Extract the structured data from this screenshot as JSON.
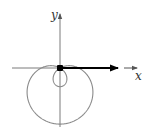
{
  "diagram": {
    "type": "polar-curve",
    "axes": {
      "x_label": "x",
      "y_label": "y"
    },
    "curve": {
      "equation": "r = a - b sin(theta)",
      "a": 1,
      "b": 2,
      "color": "#8a8a8a"
    },
    "vector": {
      "from": "origin",
      "direction": "positive x",
      "color": "#000000"
    },
    "colors": {
      "axis": "#7a7a7a",
      "curve": "#8a8a8a",
      "vector": "#000000",
      "origin_dot": "#000000"
    }
  }
}
